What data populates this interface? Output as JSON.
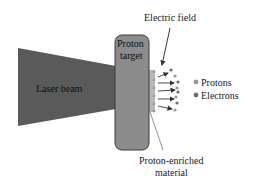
{
  "diagram": {
    "laser_label": "Laser beam",
    "target_label_1": "Proton",
    "target_label_2": "target",
    "field_label": "Electric field",
    "material_label_1": "Proton-enriched",
    "material_label_2": "material",
    "legend": [
      {
        "label": "Protons",
        "color": "#999999"
      },
      {
        "label": "Electrons",
        "color": "#6e6e6e"
      }
    ],
    "colors": {
      "laser": "#5a5a5a",
      "target": "#8c8c8c",
      "target_border": "#3a3a3a",
      "enriched_layer": "#b8b8b8",
      "arrow": "#333333"
    }
  }
}
